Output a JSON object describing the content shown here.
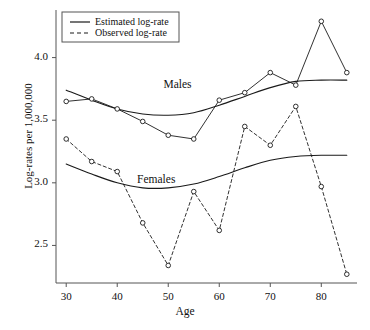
{
  "chart_data": {
    "type": "line",
    "title": "",
    "xlabel": "Age",
    "ylabel": "Log-rates per 1,000,000",
    "xlim": [
      28,
      87
    ],
    "ylim": [
      2.2,
      4.38
    ],
    "xticks": [
      30,
      40,
      50,
      60,
      70,
      80
    ],
    "yticks": [
      2.5,
      3.0,
      3.5,
      4.0
    ],
    "xtick_labels": [
      "30",
      "40",
      "50",
      "60",
      "70",
      "80"
    ],
    "ytick_labels": [
      "2.5",
      "3.0",
      "3.5",
      "4.0"
    ],
    "grid": false,
    "legend_position": "top-left",
    "x": [
      30,
      35,
      40,
      45,
      50,
      55,
      60,
      65,
      70,
      75,
      80,
      85
    ],
    "series": [
      {
        "name": "Males observed log-rate",
        "group": "Males",
        "kind": "Observed log-rate",
        "style": "solid-with-markers",
        "marker": "open-circle",
        "values": [
          3.65,
          3.67,
          3.59,
          3.49,
          3.38,
          3.35,
          3.66,
          3.72,
          3.88,
          3.78,
          4.29,
          3.88
        ]
      },
      {
        "name": "Males estimated log-rate",
        "group": "Males",
        "kind": "Estimated log-rate",
        "style": "solid-smooth",
        "marker": "none",
        "values": [
          3.74,
          3.66,
          3.59,
          3.55,
          3.54,
          3.56,
          3.62,
          3.69,
          3.76,
          3.81,
          3.82,
          3.82
        ]
      },
      {
        "name": "Females observed log-rate",
        "group": "Females",
        "kind": "Observed log-rate",
        "style": "dashed-with-markers",
        "marker": "open-circle",
        "values": [
          3.35,
          3.17,
          3.09,
          2.68,
          2.34,
          2.93,
          2.62,
          3.45,
          3.3,
          3.61,
          2.97,
          2.27
        ]
      },
      {
        "name": "Females estimated log-rate",
        "group": "Females",
        "kind": "Estimated log-rate",
        "style": "solid-smooth",
        "marker": "none",
        "values": [
          3.15,
          3.07,
          3.0,
          2.96,
          2.96,
          2.99,
          3.05,
          3.12,
          3.18,
          3.21,
          3.22,
          3.22
        ]
      }
    ],
    "annotations": [
      {
        "text": "Males",
        "x": 52,
        "y": 3.78
      },
      {
        "text": "Females",
        "x": 48,
        "y": 3.02
      }
    ]
  },
  "legend": {
    "items": [
      {
        "label": "Estimated log-rate",
        "style": "solid"
      },
      {
        "label": "Observed log-rate",
        "style": "dashed"
      }
    ]
  },
  "colors": {
    "line": "#1a1a1a",
    "background": "#ffffff",
    "axis": "#555555"
  }
}
